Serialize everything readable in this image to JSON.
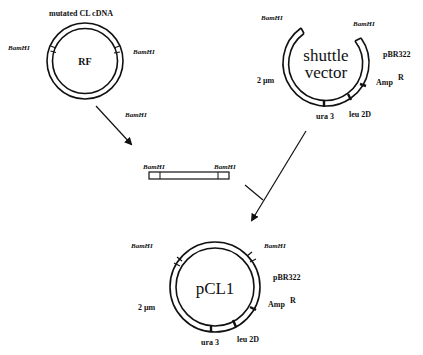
{
  "diagram": {
    "type": "plasmid-construction",
    "colors": {
      "ink": "#111111",
      "background": "#ffffff"
    },
    "rf_plasmid": {
      "label": "RF",
      "insert_label": "mutated CL cDNA",
      "sites": [
        "BamHI",
        "BamHI"
      ]
    },
    "arrow_rf_to_fragment": {
      "label": "BamHI"
    },
    "shuttle_vector": {
      "label_line1": "shuttle",
      "label_line2": "vector",
      "sites": [
        "BamHI",
        "BamHI"
      ],
      "markers": {
        "pbr322": "pBR322",
        "amp": "Amp",
        "amp_sup": "R",
        "two_micron": "2 µm",
        "ura3": "ura 3",
        "leu2d": "leu 2D"
      }
    },
    "fragment": {
      "sites": [
        "BamHI",
        "BamHI"
      ]
    },
    "product_plasmid": {
      "label": "pCL1",
      "sites": [
        "BamHI",
        "BamHI"
      ],
      "markers": {
        "pbr322": "pBR322",
        "amp": "Amp",
        "amp_sup": "R",
        "two_micron": "2 µm",
        "ura3": "ura 3",
        "leu2d": "leu 2D"
      }
    }
  }
}
